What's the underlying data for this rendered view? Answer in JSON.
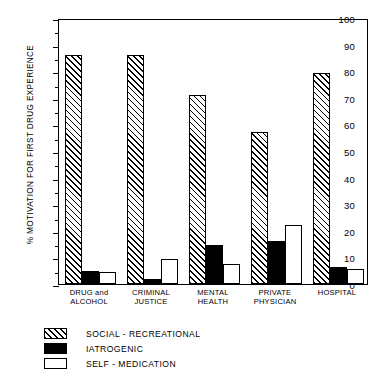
{
  "chart_data": {
    "type": "bar",
    "title": "",
    "xlabel": "",
    "ylabel": "% MOTIVATION FOR FIRST DRUG EXPERIENCE",
    "ylim": [
      0,
      100
    ],
    "ytick_step": 10,
    "yminor_step": 5,
    "grid": false,
    "legend_position": "below-left",
    "categories": [
      "DRUG and\nALCOHOL",
      "CRIMINAL\nJUSTICE",
      "MENTAL\nHEALTH",
      "PRIVATE\nPHYSICIAN",
      "HOSPITAL"
    ],
    "ytick_labels": [
      "0",
      "10",
      "20",
      "30",
      "40",
      "50",
      "60",
      "70",
      "80",
      "90",
      "100"
    ],
    "series": [
      {
        "name": "SOCIAL - RECREATIONAL",
        "fill": "hatched",
        "color": "#000000",
        "values": [
          86,
          86,
          71,
          57,
          79.5
        ]
      },
      {
        "name": "IATROGENIC",
        "fill": "solid-black",
        "color": "#000000",
        "values": [
          4.8,
          2,
          14.8,
          16,
          6.5
        ]
      },
      {
        "name": "SELF - MEDICATION",
        "fill": "white",
        "color": "#ffffff",
        "values": [
          4.5,
          9.5,
          7.5,
          22,
          5.5
        ]
      }
    ]
  }
}
